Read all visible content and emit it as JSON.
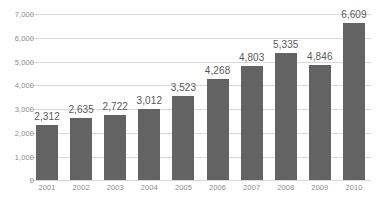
{
  "chart_data": {
    "type": "bar",
    "title": "",
    "subtitle": "",
    "xlabel": "",
    "ylabel": "",
    "categories": [
      "2001",
      "2002",
      "2003",
      "2004",
      "2005",
      "2006",
      "2007",
      "2008",
      "2009",
      "2010"
    ],
    "values": [
      2312,
      2635,
      2722,
      3012,
      3523,
      4268,
      4803,
      5335,
      4846,
      6609
    ],
    "data_labels": [
      "2,312",
      "2,635",
      "2,722",
      "3,012",
      "3,523",
      "4,268",
      "4,803",
      "5,335",
      "4,846",
      "6,609"
    ],
    "ylim": [
      0,
      7000
    ],
    "ytick_values": [
      0,
      1000,
      2000,
      3000,
      4000,
      5000,
      6000,
      7000
    ],
    "ytick_labels": [
      "0",
      "1,000",
      "2,000",
      "3,000",
      "4,000",
      "5,000",
      "6,000",
      "7,000"
    ],
    "grid": true,
    "grid_axis": "y",
    "legend": false,
    "legend_position": "none",
    "series": [
      {
        "name": "",
        "values": [
          2312,
          2635,
          2722,
          3012,
          3523,
          4268,
          4803,
          5335,
          4846,
          6609
        ]
      }
    ],
    "colors": {
      "bar_fill": "#636363",
      "gridline": "#d9d9d9",
      "axis_label": "#8c8c8c",
      "data_label": "#595959",
      "background": "#ffffff"
    }
  }
}
